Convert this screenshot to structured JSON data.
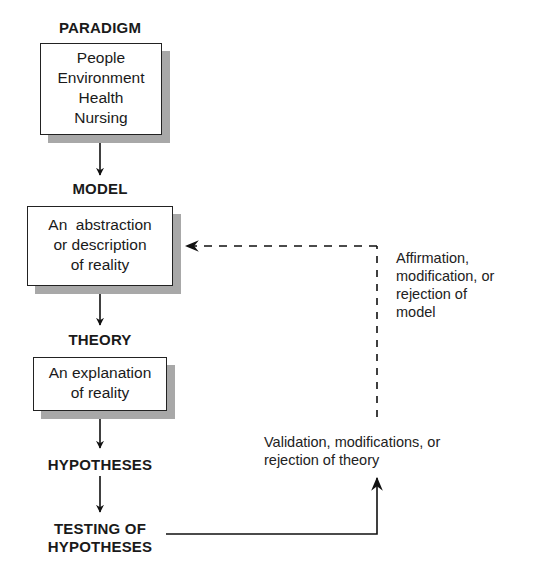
{
  "diagram": {
    "nodes": {
      "paradigm": {
        "heading": "PARADIGM",
        "lines": [
          "People",
          "Environment",
          "Health",
          "Nursing"
        ]
      },
      "model": {
        "heading": "MODEL",
        "lines": [
          "An  abstraction",
          "or description",
          "of reality"
        ]
      },
      "theory": {
        "heading": "THEORY",
        "lines": [
          "An explanation",
          "of reality"
        ]
      },
      "hypotheses": {
        "heading": "HYPOTHESES"
      },
      "testing": {
        "heading_line1": "TESTING OF",
        "heading_line2": "HYPOTHESES"
      }
    },
    "feedback": {
      "model_feedback": {
        "lines": [
          "Affirmation,",
          "modification, or",
          "rejection of",
          "model"
        ]
      },
      "theory_feedback": {
        "lines": [
          "Validation, modifications, or",
          "rejection of theory"
        ]
      }
    },
    "edges": [
      {
        "from": "paradigm",
        "to": "model",
        "style": "solid"
      },
      {
        "from": "model",
        "to": "theory",
        "style": "solid"
      },
      {
        "from": "theory",
        "to": "hypotheses",
        "style": "solid"
      },
      {
        "from": "hypotheses",
        "to": "testing",
        "style": "solid"
      },
      {
        "from": "testing",
        "to": "theory_feedback",
        "style": "solid"
      },
      {
        "from": "theory_feedback",
        "to": "model",
        "style": "dashed"
      }
    ]
  }
}
